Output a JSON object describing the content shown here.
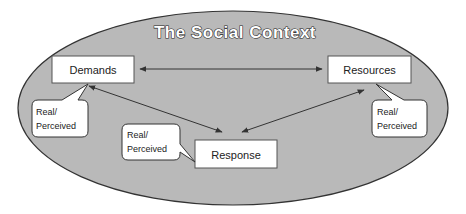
{
  "diagram": {
    "title": "The Social Context",
    "colors": {
      "context_fill": "#b9b9b9",
      "context_stroke": "#333333",
      "box_fill": "#ffffff",
      "box_stroke": "#555555",
      "arrow": "#333333"
    },
    "nodes": [
      {
        "id": "demands",
        "label": "Demands"
      },
      {
        "id": "resources",
        "label": "Resources"
      },
      {
        "id": "response",
        "label": "Response"
      }
    ],
    "callouts": [
      {
        "attached_to": "demands",
        "line1": "Real/",
        "line2": "Perceived"
      },
      {
        "attached_to": "response",
        "line1": "Real/",
        "line2": "Perceived"
      },
      {
        "attached_to": "resources",
        "line1": "Real/",
        "line2": "Perceived"
      }
    ],
    "edges": [
      {
        "from": "demands",
        "to": "resources",
        "direction": "both"
      },
      {
        "from": "demands",
        "to": "response",
        "direction": "both"
      },
      {
        "from": "resources",
        "to": "response",
        "direction": "both"
      }
    ]
  }
}
